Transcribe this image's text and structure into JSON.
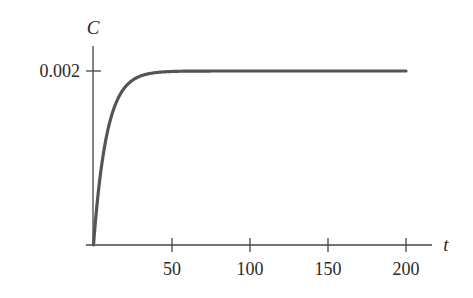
{
  "chart_data": {
    "type": "line",
    "title": "",
    "xlabel": "t",
    "ylabel": "C",
    "xlim": [
      0,
      215
    ],
    "ylim": [
      0,
      0.0023
    ],
    "x_ticks": [
      50,
      100,
      150,
      200
    ],
    "x_tick_labels": [
      "50",
      "100",
      "150",
      "200"
    ],
    "y_ticks": [
      0.002
    ],
    "y_tick_labels": [
      "0.002"
    ],
    "grid": false,
    "legend": null,
    "series": [
      {
        "name": "C(t)",
        "description": "Rapid rise from 0 approaching steady-state 0.002 (saturating exponential)",
        "x": [
          0,
          5,
          10,
          15,
          20,
          25,
          30,
          40,
          50,
          75,
          100,
          150,
          200
        ],
        "values": [
          0,
          0.00085,
          0.00134,
          0.00162,
          0.00178,
          0.00188,
          0.00193,
          0.00198,
          0.00199,
          0.002,
          0.002,
          0.002,
          0.002
        ]
      }
    ],
    "colors": {
      "curve": "#555555",
      "axes": "#444444",
      "text": "#2a2a2a"
    }
  }
}
